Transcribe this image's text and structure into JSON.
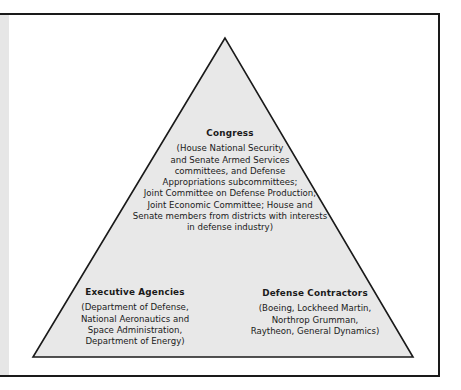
{
  "diagram": {
    "type": "iron-triangle",
    "colors": {
      "triangle_fill": "#e8e8e8",
      "stroke": "#1a1a1a",
      "left_strip": "#e6e6e6"
    },
    "nodes": {
      "congress": {
        "title": "Congress",
        "description": "(House National Security\nand Senate Armed Services\ncommittees, and Defense\nAppropriations subcommittees;\nJoint Committee on Defense Production;\nJoint Economic Committee; House and\nSenate members from districts with interests\nin defense industry)"
      },
      "executive_agencies": {
        "title": "Executive Agencies",
        "description": "(Department of Defense,\nNational Aeronautics and\nSpace Administration,\nDepartment of Energy)"
      },
      "defense_contractors": {
        "title": "Defense Contractors",
        "description": "(Boeing, Lockheed Martin,\nNorthrop Grumman,\nRaytheon, General Dynamics)"
      }
    }
  }
}
